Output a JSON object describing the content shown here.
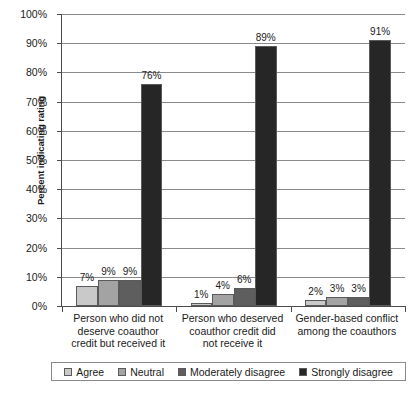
{
  "chart_data": {
    "type": "bar",
    "title": "",
    "xlabel": "",
    "ylabel": "Percent indicating rating",
    "ylim": [
      0,
      100
    ],
    "ytick_labels": [
      "0%",
      "10%",
      "20%",
      "30%",
      "40%",
      "50%",
      "60%",
      "70%",
      "80%",
      "90%",
      "100%"
    ],
    "ytick_values": [
      0,
      10,
      20,
      30,
      40,
      50,
      60,
      70,
      80,
      90,
      100
    ],
    "grid": true,
    "legend_position": "bottom",
    "categories": [
      "Person who did not deserve coauthor credit but received it",
      "Person who deserved coauthor credit did not receive it",
      "Gender-based conflict among the coauthors"
    ],
    "category_label_lines": [
      [
        "Person who did not",
        "deserve coauthor",
        "credit but received it"
      ],
      [
        "Person who deserved",
        "coauthor credit did",
        "not receive it"
      ],
      [
        "Gender-based conflict",
        "among the coauthors"
      ]
    ],
    "series": [
      {
        "name": "Agree",
        "color": "#c9c9c9",
        "values": [
          7,
          1,
          2
        ],
        "labels": [
          "7%",
          "1%",
          "2%"
        ]
      },
      {
        "name": "Neutral",
        "color": "#a3a3a3",
        "values": [
          9,
          4,
          3
        ],
        "labels": [
          "9%",
          "4%",
          "3%"
        ]
      },
      {
        "name": "Moderately disagree",
        "color": "#5e5e5e",
        "values": [
          9,
          6,
          3
        ],
        "labels": [
          "9%",
          "6%",
          "3%"
        ]
      },
      {
        "name": "Strongly disagree",
        "color": "#262626",
        "values": [
          76,
          89,
          91
        ],
        "labels": [
          "76%",
          "89%",
          "91%"
        ]
      }
    ]
  }
}
